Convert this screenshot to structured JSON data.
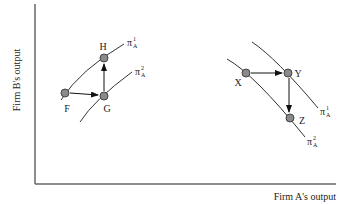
{
  "figure": {
    "axes": {
      "x_label": "Firm A's output",
      "y_label": "Firm B's output"
    },
    "panels": [
      {
        "name": "left",
        "points": [
          {
            "id": "F",
            "label": "F"
          },
          {
            "id": "G",
            "label": "G"
          },
          {
            "id": "H",
            "label": "H"
          }
        ],
        "arrows": [
          {
            "from": "F",
            "to": "G"
          },
          {
            "from": "G",
            "to": "H"
          }
        ],
        "curves": [
          {
            "id": "pi1",
            "symbol": "π",
            "sub": "A",
            "sup": "1"
          },
          {
            "id": "pi2",
            "symbol": "π",
            "sub": "A",
            "sup": "2"
          }
        ]
      },
      {
        "name": "right",
        "points": [
          {
            "id": "X",
            "label": "X"
          },
          {
            "id": "Y",
            "label": "Y"
          },
          {
            "id": "Z",
            "label": "Z"
          }
        ],
        "arrows": [
          {
            "from": "X",
            "to": "Y"
          },
          {
            "from": "Y",
            "to": "Z"
          }
        ],
        "curves": [
          {
            "id": "pi1",
            "symbol": "π",
            "sub": "A",
            "sup": "1"
          },
          {
            "id": "pi2",
            "symbol": "π",
            "sub": "A",
            "sup": "2"
          }
        ]
      }
    ],
    "colors": {
      "line": "#333333",
      "axis": "#666666",
      "dot_fill": "#8a8a8a",
      "dot_stroke": "#444444"
    }
  }
}
